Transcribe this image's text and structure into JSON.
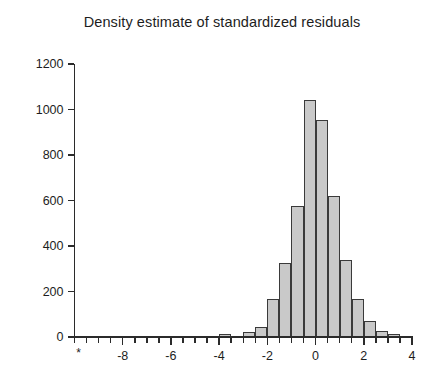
{
  "chart_data": {
    "type": "bar",
    "title": "Density estimate of standardized residuals",
    "xlabel": "",
    "ylabel": "",
    "xlim": [
      -10,
      4
    ],
    "ylim": [
      0,
      1200
    ],
    "grid": false,
    "legend": null,
    "bin_width": 0.5,
    "x_tick_labels": [
      "-8",
      "-6",
      "-4",
      "-2",
      "0",
      "2",
      "4"
    ],
    "x_tick_values": [
      -8,
      -6,
      -4,
      -2,
      0,
      2,
      4
    ],
    "x_minor_tick_step": 0.5,
    "x_origin_marker": "*",
    "y_tick_labels": [
      "0",
      "200",
      "400",
      "600",
      "800",
      "1000",
      "1200"
    ],
    "y_tick_values": [
      0,
      200,
      400,
      600,
      800,
      1000,
      1200
    ],
    "bin_starts": [
      -10,
      -9.5,
      -9,
      -8.5,
      -8,
      -7.5,
      -7,
      -6.5,
      -6,
      -5.5,
      -5,
      -4.5,
      -4,
      -3.5,
      -3,
      -2.5,
      -2,
      -1.5,
      -1,
      -0.5,
      0,
      0.5,
      1,
      1.5,
      2,
      2.5,
      3,
      3.5
    ],
    "values": [
      0,
      0,
      0,
      0,
      0,
      0,
      0,
      0,
      0,
      0,
      0,
      0,
      12,
      0,
      22,
      45,
      165,
      325,
      575,
      1040,
      955,
      620,
      340,
      165,
      70,
      25,
      12,
      6
    ],
    "bar_fill": "#c9c9c9",
    "bar_stroke": "#3a3a3a",
    "axis_color": "#2b2b2b",
    "background": "#ffffff"
  }
}
